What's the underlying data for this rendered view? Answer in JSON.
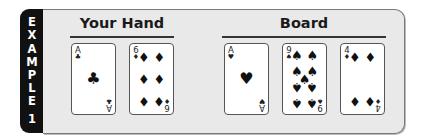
{
  "label": {
    "letters": [
      "E",
      "X",
      "A",
      "M",
      "P",
      "L",
      "E",
      "1"
    ],
    "text": "EXAMPLE 1"
  },
  "sections": {
    "hand": {
      "title": "Your Hand",
      "cards": [
        {
          "rank": "A",
          "suit": "clubs",
          "suit_symbol": "♣"
        },
        {
          "rank": "6",
          "suit": "diamonds",
          "suit_symbol": "♦"
        }
      ]
    },
    "board": {
      "title": "Board",
      "cards": [
        {
          "rank": "A",
          "suit": "hearts",
          "suit_symbol": "♥"
        },
        {
          "rank": "9",
          "suit": "spades",
          "suit_symbol": "♠"
        },
        {
          "rank": "4",
          "suit": "diamonds",
          "suit_symbol": "♦"
        }
      ]
    }
  },
  "colors": {
    "tab": "#111111",
    "panel": "#e9e9e9",
    "border": "#7a7a7a",
    "card": "#ffffff",
    "pip": "#111111"
  }
}
